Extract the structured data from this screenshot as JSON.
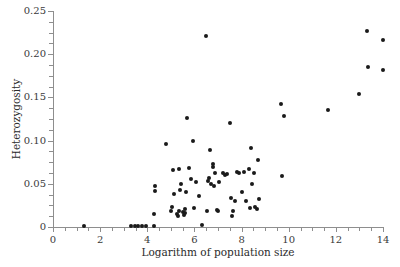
{
  "chart_data": {
    "type": "scatter",
    "title": "",
    "xlabel": "Logarithm of population size",
    "ylabel": "Heterozygosity",
    "xlim": [
      0,
      14
    ],
    "ylim": [
      0,
      0.25
    ],
    "grid": false,
    "legend": null,
    "xticks": [
      0,
      2,
      4,
      6,
      8,
      10,
      12,
      14
    ],
    "xtick_labels": [
      "0",
      "2",
      "4",
      "6",
      "8",
      "10",
      "12",
      "14"
    ],
    "xminor_step": 0.5,
    "yticks": [
      0,
      0.05,
      0.1,
      0.15,
      0.2,
      0.25
    ],
    "ytick_labels": [
      "0",
      "0.05",
      "0.10",
      "0.15",
      "0.20",
      "0.25"
    ],
    "yminor_step": 0.0125,
    "marker": "filled-circle",
    "marker_color": "#1a1a1a",
    "marker_size_px": 4,
    "points": [
      [
        1.32,
        0.001
      ],
      [
        3.3,
        0.001
      ],
      [
        3.48,
        0.001
      ],
      [
        3.62,
        0.001
      ],
      [
        3.78,
        0.001
      ],
      [
        3.95,
        0.001
      ],
      [
        4.3,
        0.001
      ],
      [
        6.3,
        0.002
      ],
      [
        4.3,
        0.015
      ],
      [
        4.32,
        0.042
      ],
      [
        4.33,
        0.047
      ],
      [
        4.78,
        0.096
      ],
      [
        5.02,
        0.018
      ],
      [
        5.05,
        0.023
      ],
      [
        5.08,
        0.066
      ],
      [
        5.12,
        0.038
      ],
      [
        5.26,
        0.015
      ],
      [
        5.3,
        0.013
      ],
      [
        5.33,
        0.019
      ],
      [
        5.36,
        0.067
      ],
      [
        5.4,
        0.043
      ],
      [
        5.42,
        0.05
      ],
      [
        5.52,
        0.017
      ],
      [
        5.56,
        0.014
      ],
      [
        5.58,
        0.021
      ],
      [
        5.62,
        0.016
      ],
      [
        5.66,
        0.041
      ],
      [
        5.7,
        0.126
      ],
      [
        5.78,
        0.068
      ],
      [
        5.86,
        0.056
      ],
      [
        5.92,
        0.099
      ],
      [
        6.0,
        0.022
      ],
      [
        6.05,
        0.052
      ],
      [
        6.18,
        0.036
      ],
      [
        6.5,
        0.221
      ],
      [
        6.52,
        0.019
      ],
      [
        6.58,
        0.053
      ],
      [
        6.62,
        0.057
      ],
      [
        6.66,
        0.089
      ],
      [
        6.7,
        0.05
      ],
      [
        6.78,
        0.073
      ],
      [
        6.8,
        0.07
      ],
      [
        6.84,
        0.047
      ],
      [
        6.88,
        0.062
      ],
      [
        6.94,
        0.02
      ],
      [
        7.0,
        0.019
      ],
      [
        7.06,
        0.052
      ],
      [
        7.22,
        0.062
      ],
      [
        7.3,
        0.06
      ],
      [
        7.4,
        0.061
      ],
      [
        7.52,
        0.12
      ],
      [
        7.55,
        0.034
      ],
      [
        7.58,
        0.013
      ],
      [
        7.62,
        0.018
      ],
      [
        7.7,
        0.03
      ],
      [
        7.82,
        0.064
      ],
      [
        7.9,
        0.063
      ],
      [
        8.0,
        0.041
      ],
      [
        8.1,
        0.064
      ],
      [
        8.2,
        0.03
      ],
      [
        8.3,
        0.067
      ],
      [
        8.34,
        0.022
      ],
      [
        8.42,
        0.091
      ],
      [
        8.46,
        0.05
      ],
      [
        8.52,
        0.062
      ],
      [
        8.58,
        0.023
      ],
      [
        8.66,
        0.021
      ],
      [
        8.7,
        0.077
      ],
      [
        8.74,
        0.032
      ],
      [
        9.68,
        0.142
      ],
      [
        9.72,
        0.059
      ],
      [
        9.8,
        0.128
      ],
      [
        11.68,
        0.135
      ],
      [
        13.0,
        0.154
      ],
      [
        13.32,
        0.227
      ],
      [
        13.36,
        0.185
      ],
      [
        14.0,
        0.217
      ],
      [
        14.02,
        0.182
      ]
    ]
  }
}
